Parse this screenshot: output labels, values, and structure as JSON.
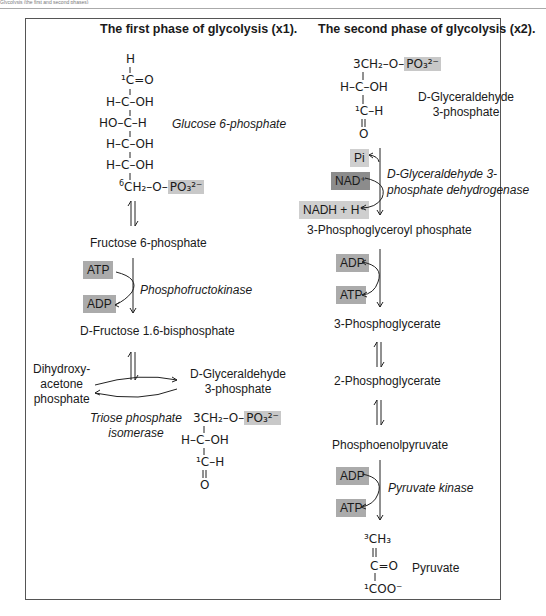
{
  "header": {
    "caption": "Glycolysis (the first and second phases)"
  },
  "left": {
    "title": "The first phase of glycolysis (x1).",
    "glucose": {
      "name": "Glucose 6-phosphate",
      "lines": [
        "H",
        "¹C=O",
        "H–C–OH",
        "HO–C–H",
        "H–C–OH",
        "H–C–OH"
      ],
      "c6_prefix": "6",
      "c6_text": "CH₂–O–",
      "phosphate": "PO₃²⁻"
    },
    "fructose6p": "Fructose 6-phosphate",
    "pfk": {
      "cofactor_in": "ATP",
      "cofactor_out": "ADP",
      "enzyme": "Phosphofructokinase"
    },
    "fructose16bp": "D-Fructose 1.6-bisphosphate",
    "dhap": {
      "line1": "Dihydroxy-",
      "line2": "acetone",
      "line3": "phosphate"
    },
    "g3p": {
      "line1": "D-Glyceraldehyde",
      "line2": "3-phosphate"
    },
    "tpi": {
      "line1": "Triose phosphate",
      "line2": "isomerase"
    },
    "g3p_structure": {
      "c3": "3CH₂–O–",
      "phosphate": "PO₃²⁻",
      "mid": "H–C–OH",
      "c1": "¹C–H",
      "o": "O"
    }
  },
  "right": {
    "title": "The second phase of glycolysis (x2).",
    "g3p_structure": {
      "c3": "3CH₂–O–",
      "phosphate": "PO₃²⁻",
      "mid": "H–C–OH",
      "c1": "¹C–H",
      "o": "O"
    },
    "g3p_name": {
      "line1": "D-Glyceraldehyde",
      "line2": "3-phosphate"
    },
    "gapdh": {
      "pi": "Pi",
      "nad": "NAD⁺",
      "nadh": "NADH + H⁺",
      "enzyme_line1": "D-Glyceraldehyde 3-",
      "enzyme_line2": "phosphate dehydrogenase"
    },
    "bpg": "3-Phosphoglyceroyl phosphate",
    "pgk": {
      "cofactor_in": "ADP",
      "cofactor_out": "ATP"
    },
    "pg3": "3-Phosphoglycerate",
    "pg2": "2-Phosphoglycerate",
    "pep": "Phosphoenolpyruvate",
    "pk": {
      "cofactor_in": "ADP",
      "cofactor_out": "ATP",
      "enzyme": "Pyruvate kinase"
    },
    "pyruvate": {
      "name": "Pyruvate",
      "c3": "³CH₃",
      "dbl": "||",
      "c2": "C=O",
      "c1": "¹COO⁻"
    }
  },
  "colors": {
    "box_light": "#cfcfcf",
    "box_mid": "#ababab",
    "box_dark": "#8c8c8c",
    "frame": "#555555"
  }
}
